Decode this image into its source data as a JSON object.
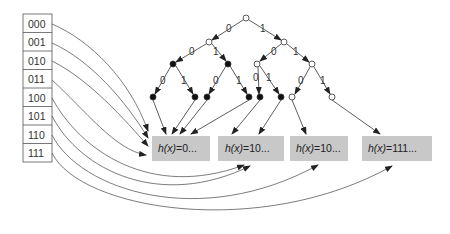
{
  "directory": {
    "entries": [
      "000",
      "001",
      "010",
      "011",
      "100",
      "101",
      "110",
      "111"
    ]
  },
  "trie": {
    "edge_labels": {
      "zero": "0",
      "one": "1"
    }
  },
  "buckets": [
    {
      "prefix_text": "h(x)",
      "value_text": "=0..."
    },
    {
      "prefix_text": "h(x)",
      "value_text": "=10..."
    },
    {
      "prefix_text": "h(x)",
      "value_text": "=10..."
    },
    {
      "prefix_text": "h(x)",
      "value_text": "=111..."
    }
  ],
  "colors": {
    "line": "#333333",
    "bucket_fill": "#c8c8c8",
    "table_border": "#555555"
  }
}
